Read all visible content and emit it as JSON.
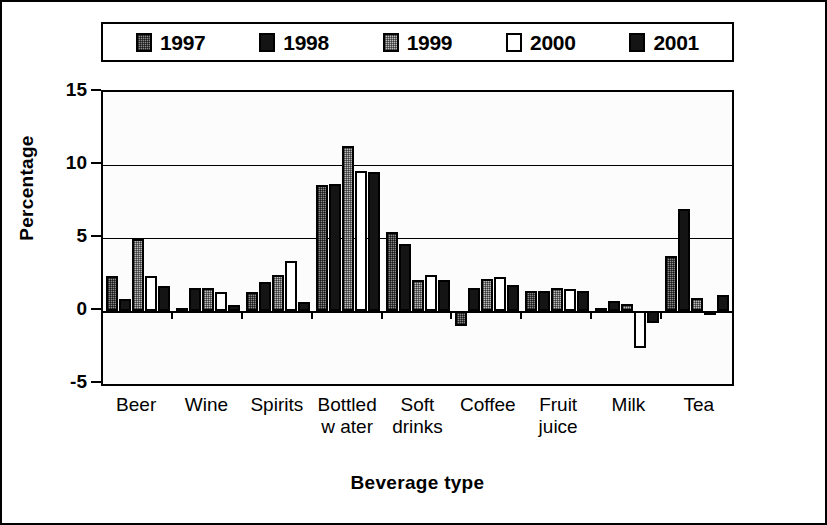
{
  "chart_data": {
    "type": "bar",
    "title": "",
    "xlabel": "Beverage type",
    "ylabel": "Percentage",
    "categories": [
      "Beer",
      "Wine",
      "Spirits",
      "Bottled w ater",
      "Soft drinks",
      "Coffee",
      "Fruit juice",
      "Milk",
      "Tea"
    ],
    "category_lines": [
      [
        "Beer"
      ],
      [
        "Wine"
      ],
      [
        "Spirits"
      ],
      [
        "Bottled",
        "w ater"
      ],
      [
        "Soft",
        "drinks"
      ],
      [
        "Coffee"
      ],
      [
        "Fruit",
        "juice"
      ],
      [
        "Milk"
      ],
      [
        "Tea"
      ]
    ],
    "series": [
      {
        "name": "1997",
        "values": [
          2.4,
          0.2,
          1.3,
          8.6,
          5.4,
          -1.0,
          1.4,
          0.2,
          3.8
        ]
      },
      {
        "name": "1998",
        "values": [
          0.8,
          1.6,
          2.0,
          8.7,
          4.6,
          1.6,
          1.4,
          0.7,
          7.0
        ]
      },
      {
        "name": "1999",
        "values": [
          4.9,
          1.6,
          2.5,
          11.3,
          2.1,
          2.2,
          1.6,
          0.5,
          0.9
        ]
      },
      {
        "name": "2000",
        "values": [
          2.4,
          1.3,
          3.4,
          9.6,
          2.5,
          2.3,
          1.5,
          -2.5,
          -0.3
        ]
      },
      {
        "name": "2001",
        "values": [
          1.7,
          0.4,
          0.6,
          9.5,
          2.1,
          1.8,
          1.4,
          -0.8,
          1.1
        ]
      }
    ],
    "ylim": [
      -5,
      15
    ],
    "yticks": [
      15,
      10,
      5,
      0,
      -5
    ],
    "ytick_labels": [
      "15",
      "10",
      "5",
      "0",
      "-5"
    ],
    "gridlines": [
      15,
      10,
      5,
      0,
      -5
    ],
    "grid": true,
    "legend_position": "top",
    "legend_entries": [
      "1997",
      "1998",
      "1999",
      "2000",
      "2001"
    ],
    "series_colors": [
      "#8a8a8a",
      "#141414",
      "#bdbdbd",
      "#ffffff",
      "#141414"
    ]
  }
}
